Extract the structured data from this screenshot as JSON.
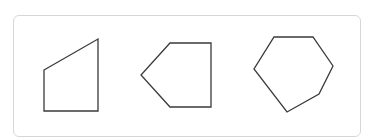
{
  "figure": {
    "stroke_color": "#3a3a3a",
    "border_color": "#d6d6d6",
    "shapes": [
      {
        "name": "quadrilateral",
        "sides": 4,
        "points": "44,70 98,39 98,111 44,111"
      },
      {
        "name": "pentagon",
        "sides": 5,
        "points": "170,43 211,43 211,107 170,107 141,75"
      },
      {
        "name": "hexagon",
        "sides": 6,
        "points": "274,37 313,37 333,66 319,94 287,112 254,69"
      }
    ]
  }
}
